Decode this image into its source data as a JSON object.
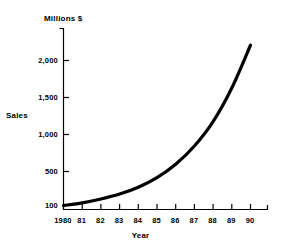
{
  "chart_data": {
    "type": "line",
    "title": "Millions $",
    "xlabel": "Year",
    "ylabel": "Sales",
    "grid": false,
    "legend": null,
    "x": [
      1980,
      1981,
      1982,
      1983,
      1984,
      1985,
      1986,
      1987,
      1988,
      1989,
      1990
    ],
    "xtick_labels": [
      "1980",
      "81",
      "82",
      "83",
      "84",
      "85",
      "86",
      "87",
      "88",
      "89",
      "90"
    ],
    "ytick_labels": [
      "100",
      "500",
      "1,000",
      "1,500",
      "2,000"
    ],
    "ytick_values": [
      100,
      500,
      1000,
      1500,
      2000
    ],
    "xlim": [
      1980,
      1990
    ],
    "ylim": [
      100,
      2300
    ],
    "series": [
      {
        "name": "Sales",
        "color": "#000000",
        "values": [
          100,
          135,
          185,
          250,
          340,
          465,
          640,
          880,
          1200,
          1640,
          2200
        ]
      }
    ]
  },
  "axes": {
    "line_color": "#000000",
    "tick_color": "#000000"
  }
}
